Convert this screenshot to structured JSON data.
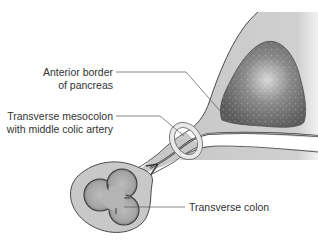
{
  "diagram": {
    "type": "anatomical-cross-section",
    "colors": {
      "background": "#ffffff",
      "tissue": "#c8c8c8",
      "tissue_stroke": "#4a4a4a",
      "pancreas": "#6e6e6e",
      "pancreas_highlight": "#d8d8d8",
      "colon": "#a8a8a8",
      "ring": "#e4e4e4",
      "leader": "#555555",
      "text": "#333333"
    },
    "labels": {
      "pancreas": {
        "line1": "Anterior border",
        "line2": "of pancreas"
      },
      "mesocolon": {
        "line1": "Transverse mesocolon",
        "line2": "with middle colic artery"
      },
      "colon": {
        "line1": "Transverse colon"
      }
    }
  }
}
